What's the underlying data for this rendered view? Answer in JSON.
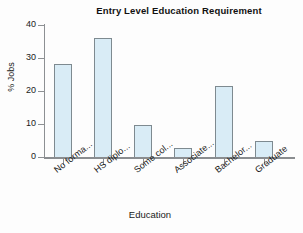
{
  "chart_data": {
    "type": "bar",
    "title": "Entry Level Education Requirement",
    "xlabel": "Education",
    "ylabel": "% Jobs",
    "categories": [
      "No forma...",
      "HS diplo...",
      "Some col...",
      "Associate...",
      "Bachelor...",
      "Graduate"
    ],
    "values": [
      28.2,
      36.1,
      9.7,
      2.6,
      21.5,
      4.8
    ],
    "ylim": [
      0,
      40
    ],
    "yticks": [
      0,
      10,
      20,
      30,
      40
    ],
    "ytick_labels": [
      "0",
      "10",
      "20",
      "30",
      "40"
    ],
    "grid": false,
    "legend": false,
    "bar_fill_color": "#d9ecf6",
    "bar_border_color": "#7e8a90",
    "axis_color": "#8a8d90",
    "background_color": "#fdfdfd"
  }
}
